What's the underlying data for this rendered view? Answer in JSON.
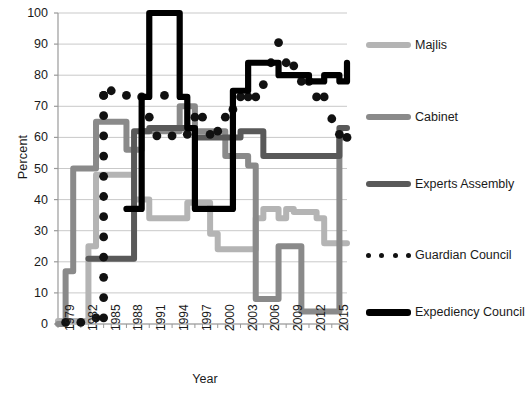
{
  "chart_data": {
    "type": "line",
    "title": "",
    "xlabel": "Year",
    "ylabel": "Percent",
    "ylim": [
      0,
      100
    ],
    "xlim": [
      1979,
      2017
    ],
    "ytick_step": 10,
    "yticks": [
      0,
      10,
      20,
      30,
      40,
      50,
      60,
      70,
      80,
      90,
      100
    ],
    "xticks_labeled": [
      1979,
      1982,
      1985,
      1988,
      1991,
      1994,
      1997,
      2000,
      2003,
      2006,
      2009,
      2012,
      2015
    ],
    "grid": "horizontal",
    "legend_position": "right",
    "series": [
      {
        "name": "Majlis",
        "color": "#b4b4b4",
        "style": "line",
        "x": [
          1979,
          1980,
          1981,
          1982,
          1983,
          1984,
          1985,
          1986,
          1987,
          1988,
          1989,
          1990,
          1991,
          1992,
          1993,
          1994,
          1995,
          1996,
          1997,
          1998,
          1999,
          2000,
          2001,
          2002,
          2003,
          2004,
          2005,
          2006,
          2007,
          2008,
          2009,
          2010,
          2011,
          2012,
          2013,
          2014,
          2015,
          2016,
          2017
        ],
        "values": [
          1,
          1,
          1,
          1,
          25,
          48,
          48,
          48,
          48,
          48,
          40,
          40,
          34,
          34,
          34,
          34,
          34,
          39,
          39,
          39,
          29,
          24,
          24,
          24,
          24,
          24,
          34,
          37,
          37,
          34,
          37,
          36,
          36,
          36,
          34,
          26,
          26,
          26,
          26
        ]
      },
      {
        "name": "Cabinet",
        "color": "#8a8a8a",
        "style": "line",
        "x": [
          1979,
          1980,
          1981,
          1982,
          1983,
          1984,
          1985,
          1986,
          1987,
          1988,
          1989,
          1990,
          1991,
          1992,
          1993,
          1994,
          1995,
          1996,
          1997,
          1998,
          1999,
          2000,
          2001,
          2002,
          2003,
          2004,
          2005,
          2006,
          2007,
          2008,
          2009,
          2010,
          2011,
          2012,
          2013,
          2014,
          2015,
          2016,
          2017
        ],
        "values": [
          0,
          17,
          50,
          50,
          50,
          65,
          65,
          65,
          65,
          56,
          56,
          62,
          62,
          62,
          62,
          62,
          70,
          70,
          62,
          62,
          62,
          62,
          54,
          54,
          54,
          51,
          8,
          8,
          8,
          25,
          25,
          25,
          4,
          4,
          4,
          4,
          4,
          60,
          60
        ]
      },
      {
        "name": "Experts Assembly",
        "color": "#595959",
        "style": "line",
        "x": [
          1983,
          1984,
          1985,
          1986,
          1987,
          1988,
          1989,
          1990,
          1991,
          1992,
          1993,
          1994,
          1995,
          1996,
          1997,
          1998,
          1999,
          2000,
          2001,
          2002,
          2003,
          2004,
          2005,
          2006,
          2007,
          2008,
          2009,
          2010,
          2011,
          2012,
          2013,
          2014,
          2015,
          2016,
          2017
        ],
        "values": [
          21,
          21,
          21,
          21,
          21,
          21,
          62,
          62,
          63,
          63,
          63,
          63,
          63,
          63,
          60,
          60,
          60,
          60,
          60,
          60,
          62,
          62,
          62,
          54,
          54,
          54,
          54,
          54,
          54,
          54,
          54,
          54,
          54,
          63,
          63
        ]
      },
      {
        "name": "Guardian Council",
        "color": "#111111",
        "style": "dots",
        "x": [
          1980,
          1982,
          1984,
          1985,
          1985,
          1985,
          1985,
          1985,
          1985,
          1985,
          1985,
          1985,
          1985,
          1985,
          1985,
          1985,
          1986,
          1988,
          1990,
          1991,
          1992,
          1993,
          1994,
          1996,
          1997,
          1998,
          1999,
          2000,
          2001,
          2002,
          2003,
          2004,
          2005,
          2006,
          2007,
          2008,
          2009,
          2010,
          2011,
          2012,
          2013,
          2014,
          2015,
          2016,
          2017
        ],
        "values": [
          0.5,
          0.5,
          2,
          2,
          8.5,
          15,
          21.5,
          28,
          34.5,
          41,
          47.5,
          54,
          60.5,
          67,
          73.5,
          73.5,
          75,
          73.5,
          73,
          66.5,
          60.5,
          73.5,
          60.5,
          61,
          66.5,
          66.5,
          61,
          62,
          66.5,
          69,
          73,
          73,
          73,
          77,
          84,
          90.5,
          84,
          83,
          78,
          78,
          73,
          73,
          66,
          61,
          60
        ]
      },
      {
        "name": "Expediency Council",
        "color": "#000000",
        "style": "line",
        "x": [
          1988,
          1989,
          1990,
          1991,
          1992,
          1993,
          1994,
          1995,
          1996,
          1997,
          1998,
          1999,
          2000,
          2001,
          2002,
          2003,
          2004,
          2005,
          2006,
          2007,
          2008,
          2009,
          2010,
          2011,
          2012,
          2013,
          2014,
          2015,
          2016,
          2017
        ],
        "values": [
          37,
          37,
          73,
          100,
          100,
          100,
          100,
          73,
          63,
          37,
          37,
          37,
          37,
          37,
          75,
          75,
          84,
          84,
          84,
          84,
          80,
          80,
          80,
          80,
          78,
          78,
          80,
          80,
          78,
          84
        ]
      }
    ]
  },
  "legend": {
    "items": [
      {
        "label": "Majlis",
        "color": "#b4b4b4",
        "style": "line"
      },
      {
        "label": "Cabinet",
        "color": "#8a8a8a",
        "style": "line"
      },
      {
        "label": "Experts Assembly",
        "color": "#595959",
        "style": "line"
      },
      {
        "label": "Guardian Council",
        "color": "#111111",
        "style": "dots"
      },
      {
        "label": "Expediency Council",
        "color": "#000000",
        "style": "line"
      }
    ]
  }
}
